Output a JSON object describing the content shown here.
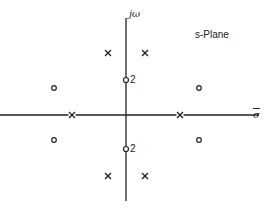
{
  "diagram": {
    "title": "s-Plane",
    "axes": {
      "vertical_label": "jω",
      "horizontal_label": "σ"
    },
    "colors": {
      "ink": "#222222",
      "background": "#ffffff"
    },
    "poles": [
      {
        "id": "pole-left-real",
        "label": "x",
        "x": 72,
        "y": 115
      },
      {
        "id": "pole-right-real",
        "label": "x",
        "x": 180,
        "y": 115
      },
      {
        "id": "pole-upper-left",
        "label": "x",
        "x": 108,
        "y": 53
      },
      {
        "id": "pole-upper-right",
        "label": "x",
        "x": 145,
        "y": 53
      },
      {
        "id": "pole-lower-left",
        "label": "x",
        "x": 108,
        "y": 176
      },
      {
        "id": "pole-lower-right",
        "label": "x",
        "x": 145,
        "y": 176
      }
    ],
    "zeros": [
      {
        "id": "zero-upper-imag",
        "label": "o",
        "multiplicity": "2",
        "x": 126,
        "y": 80
      },
      {
        "id": "zero-lower-imag",
        "label": "o",
        "multiplicity": "2",
        "x": 126,
        "y": 149
      },
      {
        "id": "zero-upper-left",
        "label": "o",
        "x": 54,
        "y": 88
      },
      {
        "id": "zero-upper-right",
        "label": "o",
        "x": 199,
        "y": 88
      },
      {
        "id": "zero-lower-left",
        "label": "o",
        "x": 54,
        "y": 140
      },
      {
        "id": "zero-lower-right",
        "label": "o",
        "x": 199,
        "y": 140
      }
    ],
    "multiplicity_labels": {
      "upper": "2",
      "lower": "2"
    }
  }
}
